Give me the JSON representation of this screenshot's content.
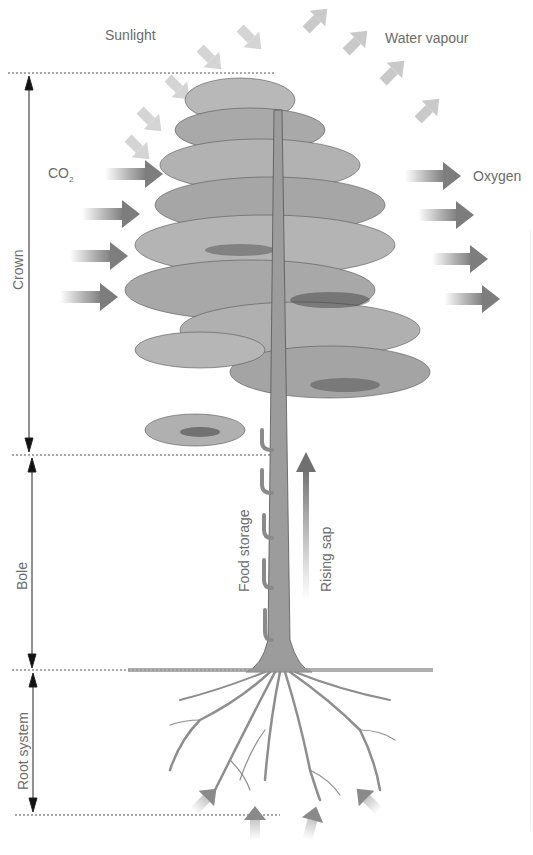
{
  "diagram": {
    "labels": {
      "sunlight": "Sunlight",
      "water_vapour": "Water vapour",
      "co2": "CO",
      "co2_sub": "2",
      "oxygen": "Oxygen",
      "crown": "Crown",
      "bole": "Bole",
      "root_system": "Root system",
      "food_storage": "Food storage",
      "rising_sap": "Rising sap"
    },
    "sections": [
      {
        "name": "Crown",
        "top_y": 73,
        "bottom_y": 455
      },
      {
        "name": "Bole",
        "top_y": 455,
        "bottom_y": 670
      },
      {
        "name": "Root system",
        "top_y": 670,
        "bottom_y": 815
      }
    ],
    "arrows": {
      "sunlight_in": 5,
      "water_vapour_out": 5,
      "co2_in": 4,
      "oxygen_out": 4,
      "water_up_from_roots": 4
    },
    "colors": {
      "text": "#6b6b6b",
      "arrow": "#8a8a8a",
      "tree_dark": "#3a3a3a",
      "tree_mid": "#8c8c8c",
      "tree_light": "#cfcfcf",
      "guide_line": "#555555"
    }
  }
}
